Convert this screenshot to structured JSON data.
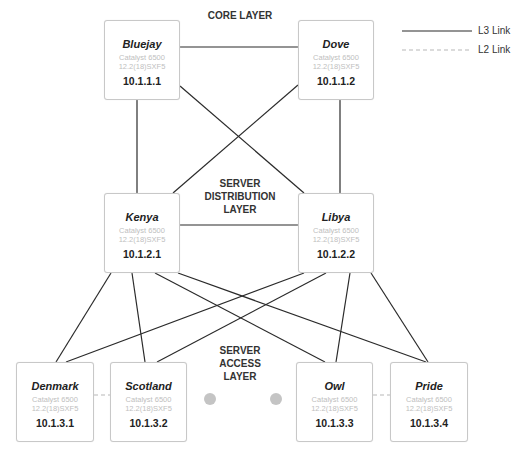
{
  "layers": {
    "core": "CORE LAYER",
    "distribution": [
      "SERVER",
      "DISTRIBUTION",
      "LAYER"
    ],
    "access": [
      "SERVER",
      "ACCESS",
      "LAYER"
    ]
  },
  "legend": {
    "l3": "L3 Link",
    "l2": "L2 Link"
  },
  "devices": {
    "bluejay": {
      "name": "Bluejay",
      "model": "Catalyst 6500",
      "ios": "12.2(18)SXF5",
      "ip": "10.1.1.1"
    },
    "dove": {
      "name": "Dove",
      "model": "Catalyst 6500",
      "ios": "12.2(18)SXF5",
      "ip": "10.1.1.2"
    },
    "kenya": {
      "name": "Kenya",
      "model": "Catalyst 6500",
      "ios": "12.2(18)SXF5",
      "ip": "10.1.2.1"
    },
    "libya": {
      "name": "Libya",
      "model": "Catalyst 6500",
      "ios": "12.2(18)SXF5",
      "ip": "10.1.2.2"
    },
    "denmark": {
      "name": "Denmark",
      "model": "Catalyst 6500",
      "ios": "12.2(18)SXF5",
      "ip": "10.1.3.1"
    },
    "scotland": {
      "name": "Scotland",
      "model": "Catalyst 6500",
      "ios": "12.2(18)SXF5",
      "ip": "10.1.3.2"
    },
    "owl": {
      "name": "Owl",
      "model": "Catalyst 6500",
      "ios": "12.2(18)SXF5",
      "ip": "10.1.3.3"
    },
    "pride": {
      "name": "Pride",
      "model": "Catalyst 6500",
      "ios": "12.2(18)SXF5",
      "ip": "10.1.3.4"
    }
  },
  "links": {
    "l3": [
      [
        "Bluejay",
        "Dove"
      ],
      [
        "Bluejay",
        "Kenya"
      ],
      [
        "Bluejay",
        "Libya"
      ],
      [
        "Dove",
        "Kenya"
      ],
      [
        "Dove",
        "Libya"
      ],
      [
        "Kenya",
        "Libya"
      ],
      [
        "Kenya",
        "Denmark"
      ],
      [
        "Kenya",
        "Scotland"
      ],
      [
        "Kenya",
        "Owl"
      ],
      [
        "Kenya",
        "Pride"
      ],
      [
        "Libya",
        "Denmark"
      ],
      [
        "Libya",
        "Scotland"
      ],
      [
        "Libya",
        "Owl"
      ],
      [
        "Libya",
        "Pride"
      ]
    ],
    "l2": [
      [
        "Denmark",
        "Scotland"
      ],
      [
        "Owl",
        "Pride"
      ]
    ]
  }
}
